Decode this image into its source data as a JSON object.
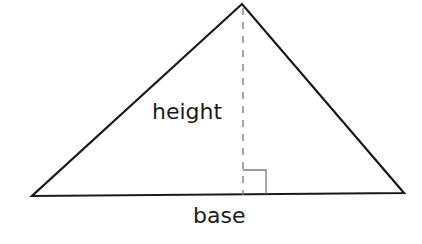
{
  "diagram": {
    "type": "triangle-area-diagram",
    "shape": "triangle",
    "labels": {
      "height": "height",
      "base": "base"
    },
    "vertices": {
      "apex": [
        242,
        4
      ],
      "base_left": [
        32,
        196
      ],
      "base_right": [
        404,
        193
      ]
    },
    "height_line": {
      "style": "dashed",
      "x": 243,
      "from_y": 6,
      "to_y": 195
    },
    "right_angle_marker": {
      "x": 243,
      "y": 170,
      "size": 23
    },
    "colors": {
      "stroke": "#1a1a1a",
      "dashed": "#777777",
      "marker": "#777777",
      "background": "#ffffff"
    }
  }
}
